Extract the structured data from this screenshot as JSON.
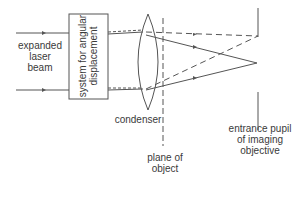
{
  "diagram": {
    "labels": {
      "input": [
        "expanded",
        "laser",
        "beam"
      ],
      "system": [
        "system for angular",
        "displacement"
      ],
      "condenser": "condenser",
      "plane": [
        "plane of",
        "object"
      ],
      "pupil": [
        "entrance pupil",
        "of imaging",
        "objective"
      ]
    },
    "colors": {
      "line": "#555555",
      "text": "#3a3a3a"
    }
  }
}
